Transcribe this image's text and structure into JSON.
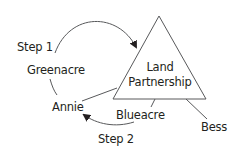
{
  "diagram": {
    "center_node": {
      "label_line1": "Land",
      "label_line2": "Partnership",
      "shape": "triangle"
    },
    "nodes": [
      {
        "id": "greenacre",
        "label": "Greenacre"
      },
      {
        "id": "annie",
        "label": "Annie"
      },
      {
        "id": "blueacre",
        "label": "Blueacre"
      },
      {
        "id": "bess",
        "label": "Bess"
      }
    ],
    "steps": [
      {
        "id": "step1",
        "label": "Step 1"
      },
      {
        "id": "step2",
        "label": "Step 2"
      }
    ],
    "colors": {
      "stroke": "#58595b",
      "text": "#231f20",
      "background": "#ffffff"
    }
  }
}
